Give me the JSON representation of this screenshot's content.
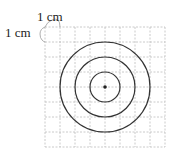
{
  "diagram": {
    "type": "concentric-circles-on-grid",
    "scale_labels": {
      "horizontal": "1 cm",
      "vertical": "1 cm"
    },
    "grid": {
      "cols": 8,
      "rows": 8,
      "cell_size_cm": 1
    },
    "circles": [
      {
        "radius_cm": 1
      },
      {
        "radius_cm": 2
      },
      {
        "radius_cm": 3
      }
    ],
    "center_point": {
      "col": 4,
      "row": 4
    },
    "colors": {
      "grid": "#bdbdbd",
      "circle": "#333333",
      "text": "#222222"
    }
  }
}
